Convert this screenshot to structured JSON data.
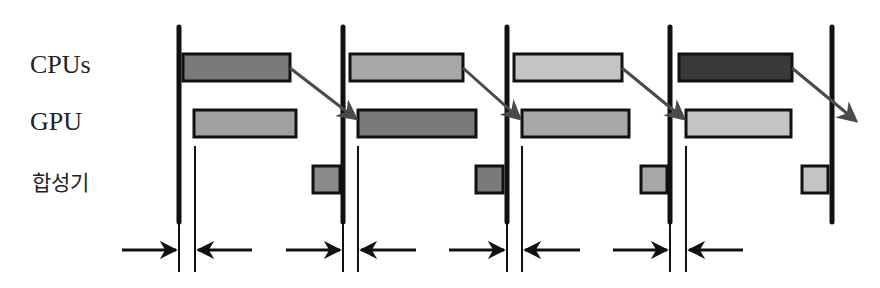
{
  "rows": {
    "cpu_label": "CPUs",
    "gpu_label": "GPU",
    "compositor_label": "합성기"
  },
  "colors": {
    "frame1": "#7a7a7a",
    "frame2": "#a8a8a8",
    "frame3": "#c4c4c4",
    "frame4": "#3a3a3a",
    "outline": "#111111",
    "arrow": "#4a4a4a"
  },
  "vsync_x": [
    179,
    343,
    507,
    670,
    832
  ],
  "cpu_bars": [
    {
      "x1": 183,
      "x2": 290,
      "color": "#7a7a7a"
    },
    {
      "x1": 350,
      "x2": 463,
      "color": "#a8a8a8"
    },
    {
      "x1": 514,
      "x2": 622,
      "color": "#c4c4c4"
    },
    {
      "x1": 679,
      "x2": 792,
      "color": "#3a3a3a"
    }
  ],
  "gpu_bars": [
    {
      "x1": 194,
      "x2": 296,
      "color": "#a0a0a0"
    },
    {
      "x1": 358,
      "x2": 476,
      "color": "#7a7a7a"
    },
    {
      "x1": 522,
      "x2": 629,
      "color": "#a8a8a8"
    },
    {
      "x1": 686,
      "x2": 791,
      "color": "#c4c4c4"
    }
  ],
  "compositor_bars": [
    {
      "x1": 313,
      "x2": 339,
      "color": "#8a8a8a"
    },
    {
      "x1": 476,
      "x2": 503,
      "color": "#7a7a7a"
    },
    {
      "x1": 641,
      "x2": 667,
      "color": "#a8a8a8"
    },
    {
      "x1": 802,
      "x2": 828,
      "color": "#c4c4c4"
    }
  ]
}
